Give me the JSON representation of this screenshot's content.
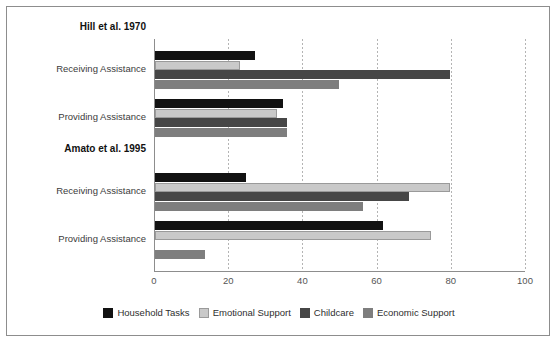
{
  "chart_data": {
    "type": "bar",
    "orientation": "horizontal",
    "title": "",
    "xlabel": "",
    "ylabel": "",
    "xlim": [
      0,
      100
    ],
    "xticks": [
      0,
      20,
      40,
      60,
      80,
      100
    ],
    "grid": "vertical-dotted",
    "legend_position": "bottom",
    "series": [
      {
        "name": "Household Tasks",
        "color": "#121212"
      },
      {
        "name": "Emotional Support",
        "color": "#c9c9c9"
      },
      {
        "name": "Childcare",
        "color": "#464646"
      },
      {
        "name": "Economic Support",
        "color": "#7e7e7e"
      }
    ],
    "groups": [
      {
        "title": "Hill et al. 1970",
        "rows": [
          {
            "label": "Receiving Assistance",
            "values": [
              27,
              23,
              79.5,
              49.5
            ]
          },
          {
            "label": "Providing Assistance",
            "values": [
              34.5,
              33,
              35.5,
              35.5
            ]
          }
        ]
      },
      {
        "title": "Amato et al. 1995",
        "rows": [
          {
            "label": "Receiving Assistance",
            "values": [
              24.5,
              79.5,
              68.5,
              56
            ]
          },
          {
            "label": "Providing Assistance",
            "values": [
              61.5,
              74.5,
              0,
              13.5
            ]
          }
        ]
      }
    ]
  },
  "legend": {
    "items": [
      {
        "label": "Household Tasks",
        "swatch": "household-tasks-swatch"
      },
      {
        "label": "Emotional Support",
        "swatch": "emotional-support-swatch"
      },
      {
        "label": "Childcare",
        "swatch": "childcare-swatch"
      },
      {
        "label": "Economic Support",
        "swatch": "economic-support-swatch"
      }
    ]
  },
  "axis": {
    "tick_labels": [
      "0",
      "20",
      "40",
      "60",
      "80",
      "100"
    ]
  },
  "labels": {
    "group_0_title": "Hill et al. 1970",
    "group_1_title": "Amato et al. 1995",
    "group_0_row_0": "Receiving Assistance",
    "group_0_row_1": "Providing Assistance",
    "group_1_row_0": "Receiving Assistance",
    "group_1_row_1": "Providing Assistance"
  }
}
